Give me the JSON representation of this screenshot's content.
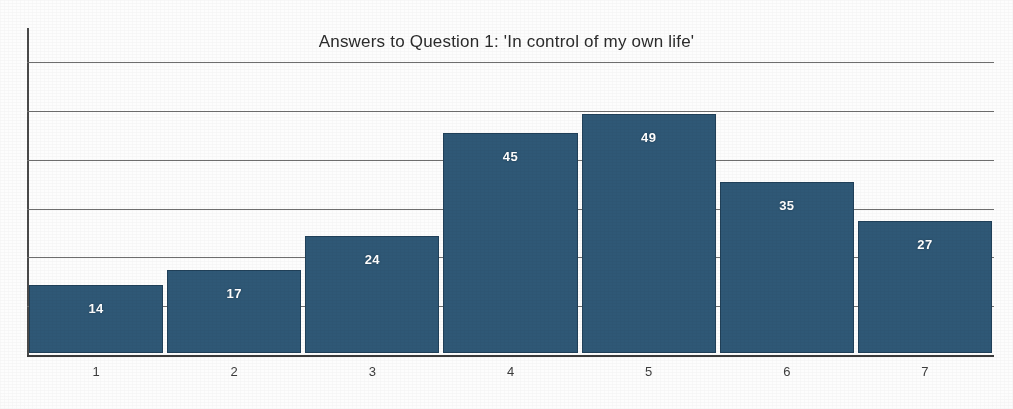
{
  "chart_data": {
    "type": "bar",
    "title": "Answers to Question 1: 'In control of my own life'",
    "xlabel": "",
    "ylabel": "",
    "categories": [
      "1",
      "2",
      "3",
      "4",
      "5",
      "6",
      "7"
    ],
    "values": [
      14,
      17,
      24,
      45,
      49,
      35,
      27
    ],
    "value_labels": [
      "14",
      "17",
      "24",
      "45",
      "49",
      "35",
      "27"
    ],
    "ylim": [
      0,
      67
    ],
    "grid": true,
    "gridlines": [
      10,
      20,
      30,
      40,
      50,
      60
    ],
    "y_tick_labels_visible": false,
    "legend": null,
    "legend_position": "none",
    "bar_color": "#2f5876",
    "label_color": "#ffffff",
    "axis_color": "#4a4a4a",
    "gridline_color": "#6e6e6e",
    "background_color": "#ffffff"
  }
}
